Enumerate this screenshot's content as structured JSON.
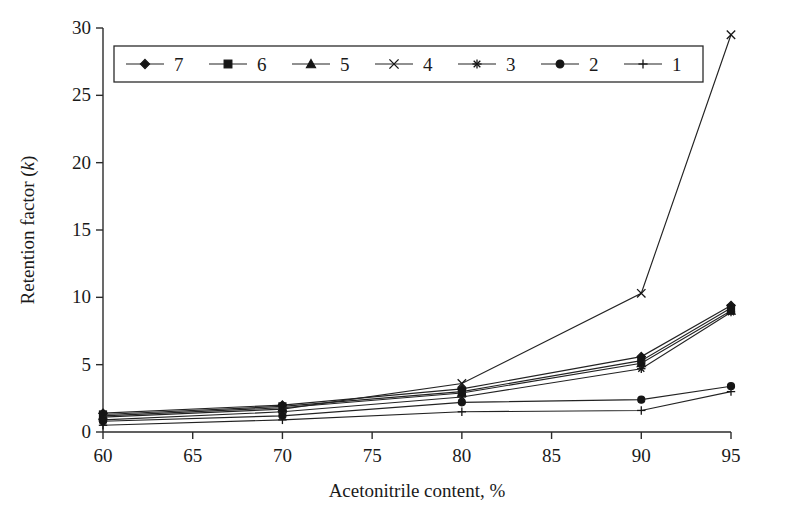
{
  "chart_data": {
    "type": "line",
    "title": "",
    "xlabel": "Acetonitrile content, %",
    "ylabel": "Retention factor (k)",
    "ylabel_plain": "Retention factor",
    "ylabel_italic": "k",
    "x": [
      60,
      70,
      80,
      90,
      95
    ],
    "xlim": [
      60,
      95
    ],
    "ylim": [
      0,
      30
    ],
    "xticks": [
      60,
      65,
      70,
      75,
      80,
      85,
      90,
      95
    ],
    "xticklabels": [
      "60",
      "65",
      "70",
      "75",
      "80",
      "85",
      "90",
      "95"
    ],
    "yticks": [
      0,
      5,
      10,
      15,
      20,
      25,
      30
    ],
    "yticklabels": [
      "0",
      "5",
      "10",
      "15",
      "20",
      "25",
      "30"
    ],
    "grid": false,
    "legend_position": "top-left-inside",
    "series": [
      {
        "name": "7",
        "marker": "diamond",
        "values": [
          1.4,
          2.0,
          3.2,
          5.6,
          9.4
        ]
      },
      {
        "name": "6",
        "marker": "square",
        "values": [
          1.3,
          1.9,
          3.0,
          5.3,
          9.2
        ]
      },
      {
        "name": "5",
        "marker": "triangle",
        "values": [
          1.2,
          1.8,
          2.9,
          5.1,
          9.0
        ]
      },
      {
        "name": "4",
        "marker": "x",
        "values": [
          1.1,
          1.7,
          3.6,
          10.3,
          29.5
        ]
      },
      {
        "name": "3",
        "marker": "asterisk",
        "values": [
          0.9,
          1.5,
          2.6,
          4.7,
          8.9
        ]
      },
      {
        "name": "2",
        "marker": "circle",
        "values": [
          0.8,
          1.2,
          2.2,
          2.4,
          3.4
        ]
      },
      {
        "name": "1",
        "marker": "plus",
        "values": [
          0.5,
          0.9,
          1.5,
          1.6,
          3.0
        ]
      }
    ],
    "colors": {
      "axis": "#2b2b2b",
      "line": "#232323",
      "marker": "#151515",
      "background": "#ffffff"
    }
  },
  "legend": {
    "entries": [
      {
        "label": "7",
        "marker": "diamond"
      },
      {
        "label": "6",
        "marker": "square"
      },
      {
        "label": "5",
        "marker": "triangle"
      },
      {
        "label": "4",
        "marker": "x"
      },
      {
        "label": "3",
        "marker": "asterisk"
      },
      {
        "label": "2",
        "marker": "circle"
      },
      {
        "label": "1",
        "marker": "plus"
      }
    ]
  }
}
